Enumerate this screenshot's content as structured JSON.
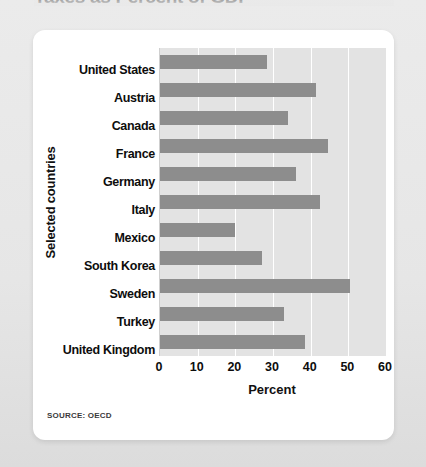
{
  "headline": "Taxes as Percent of GDP",
  "source_note": "SOURCE: OECD",
  "colors": {
    "bar": "#8d8d8d",
    "plot_background": "#e3e3e3",
    "gridline": "#ffffff",
    "card": "#ffffff",
    "page_background": "#e9e9e9"
  },
  "chart_data": {
    "type": "bar",
    "orientation": "horizontal",
    "title": "Taxes as Percent of GDP",
    "xlabel": "Percent",
    "ylabel": "Selected countries",
    "xlim": [
      0,
      60
    ],
    "xticks": [
      0,
      10,
      20,
      30,
      40,
      50,
      60
    ],
    "grid": true,
    "legend": "none",
    "categories": [
      "United States",
      "Austria",
      "Canada",
      "France",
      "Germany",
      "Italy",
      "Mexico",
      "South Korea",
      "Sweden",
      "Turkey",
      "United Kingdom"
    ],
    "values": [
      28.5,
      41.5,
      34,
      44.5,
      36,
      42.5,
      20,
      27,
      50.5,
      33,
      38.5
    ],
    "units": "percent"
  }
}
